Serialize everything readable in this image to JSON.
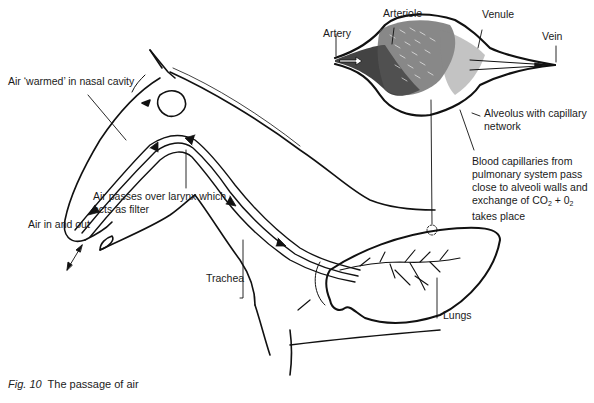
{
  "caption": {
    "fig_label": "Fig. 10",
    "title": "The passage of air"
  },
  "labels": {
    "nasal": "Air ‘warmed’ in nasal cavity",
    "larynx_1": "Air passes over larynx which",
    "larynx_2": "acts as filter",
    "air_in_out": "Air in and out",
    "trachea": "Trachea",
    "lungs": "Lungs",
    "artery": "Artery",
    "arteriole": "Arteriole",
    "venule": "Venule",
    "vein": "Vein",
    "alveolus_1": "Alveolus with capillary",
    "alveolus_2": "network",
    "blood_1": "Blood capillaries from",
    "blood_2": "pulmonary system pass",
    "blood_3": "close to alveoli walls and",
    "blood_4_pre": "exchange of CO",
    "blood_4_sub1": "2",
    "blood_4_mid": " + 0",
    "blood_4_sub2": "2",
    "blood_5": "takes place"
  },
  "colors": {
    "ink": "#111111",
    "background": "#ffffff"
  }
}
